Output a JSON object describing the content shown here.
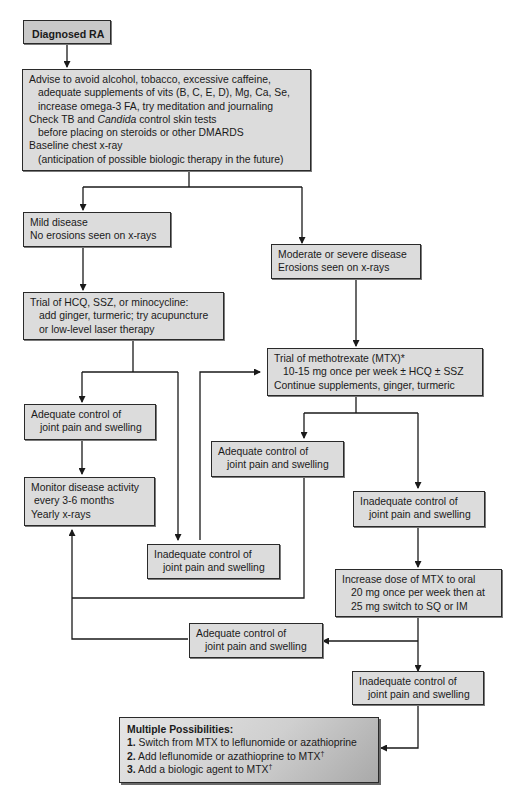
{
  "diagram": {
    "colors": {
      "box_fill": "#dcdcdc",
      "start_fill": "#c9c9c9",
      "border": "#2a2a2a",
      "arrow": "#1a1a1a"
    },
    "nodes": {
      "diagnosed": {
        "label": "Diagnosed RA"
      },
      "advise": {
        "lines": [
          "Advise to avoid alcohol, tobacco, excessive caffeine,",
          "adequate supplements of vits (B, C, E, D), Mg, Ca, Se,",
          "increase omega-3 FA, try meditation and journaling",
          "Check TB and",
          "Candida",
          "control skin tests",
          "before placing on steroids or other DMARDS",
          "Baseline chest x-ray",
          "(anticipation of possible biologic therapy in the future)"
        ]
      },
      "mild": {
        "lines": [
          "Mild disease",
          "No erosions seen on x-rays"
        ]
      },
      "moderate": {
        "lines": [
          "Moderate or severe disease",
          "Erosions seen on x-rays"
        ]
      },
      "trial_hcq": {
        "lines": [
          "Trial of HCQ, SSZ, or minocycline:",
          "add ginger, turmeric; try acupuncture",
          "or low-level laser therapy"
        ]
      },
      "trial_mtx": {
        "lines": [
          "Trial of methotrexate (MTX)*",
          "10-15 mg once per week ± HCQ ± SSZ",
          "Continue supplements, ginger, turmeric"
        ]
      },
      "adequate_left": {
        "lines": [
          "Adequate control of",
          "joint pain and swelling"
        ]
      },
      "monitor": {
        "lines": [
          "Monitor disease activity",
          "every 3-6 months",
          "Yearly x-rays"
        ]
      },
      "inadequate_left": {
        "lines": [
          "Inadequate control of",
          "joint pain and swelling"
        ]
      },
      "adequate_mtx": {
        "lines": [
          "Adequate control of",
          "joint pain and swelling"
        ]
      },
      "inadequate_mtx": {
        "lines": [
          "Inadequate control of",
          "joint pain and swelling"
        ]
      },
      "increase_mtx": {
        "lines": [
          "Increase dose of MTX to oral",
          "20 mg once per week then at",
          "25 mg switch to SQ or IM"
        ]
      },
      "adequate_high": {
        "lines": [
          "Adequate control of",
          "joint pain and swelling"
        ]
      },
      "inadequate_high": {
        "lines": [
          "Inadequate control of",
          "joint pain and swelling"
        ]
      },
      "multiple": {
        "title": "Multiple Possibilities:",
        "items": [
          {
            "num": "1.",
            "text": "Switch from MTX to leflunomide or azathioprine",
            "mark": ""
          },
          {
            "num": "2.",
            "text": "Add leflunomide or azathioprine to MTX",
            "mark": "†"
          },
          {
            "num": "3.",
            "text": "Add a biologic agent to MTX",
            "mark": "†"
          }
        ]
      }
    }
  }
}
